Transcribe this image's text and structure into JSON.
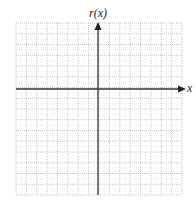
{
  "graph": {
    "y_axis_label": "r(x)",
    "x_axis_label": "x",
    "grid": {
      "left": 16,
      "top": 23,
      "right": 182,
      "bottom": 195,
      "columns": 16,
      "rows": 16,
      "origin_px": {
        "x": 98,
        "y": 89
      },
      "line_color": "#b8b8b8",
      "axis_color": "#333333"
    }
  },
  "chart_data": {
    "type": "blank_coordinate_grid",
    "title": "",
    "xlabel": "x",
    "ylabel": "r(x)",
    "grid": true,
    "ticks_labeled": false,
    "series": []
  }
}
